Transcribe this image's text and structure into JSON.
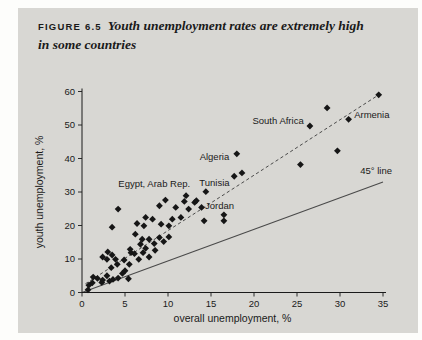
{
  "figure": {
    "label": "FIGURE 6.5",
    "title_line1": "Youth unemployment rates are extremely high",
    "title_line2": "in some countries"
  },
  "colors": {
    "page_bg": "#fdfdfb",
    "panel_bg": "#d8d7d3",
    "ink": "#1a1a1a",
    "marker": "#161616",
    "ref_line": "#4a4a4a",
    "trend_line": "#3a3a3a"
  },
  "chart_data": {
    "type": "scatter",
    "xlabel": "overall unemployment, %",
    "ylabel": "youth unemployment, %",
    "xlim": [
      0,
      35
    ],
    "ylim": [
      0,
      60
    ],
    "xticks": [
      0,
      5,
      10,
      15,
      20,
      25,
      30,
      35
    ],
    "yticks": [
      0,
      10,
      20,
      30,
      40,
      50,
      60
    ],
    "grid": false,
    "legend": "none",
    "points": [
      [
        0.7,
        0.8
      ],
      [
        0.8,
        2.2
      ],
      [
        1.2,
        2.9
      ],
      [
        1.3,
        4.6
      ],
      [
        1.8,
        4.2
      ],
      [
        2.3,
        3.0
      ],
      [
        2.4,
        3.7
      ],
      [
        2.9,
        5.0
      ],
      [
        3.2,
        3.4
      ],
      [
        3.6,
        3.9
      ],
      [
        4.2,
        4.3
      ],
      [
        4.7,
        5.7
      ],
      [
        5.4,
        4.1
      ],
      [
        5.0,
        6.5
      ],
      [
        3.4,
        7.4
      ],
      [
        4.1,
        8.4
      ],
      [
        4.9,
        9.7
      ],
      [
        5.5,
        8.4
      ],
      [
        5.7,
        11.9
      ],
      [
        2.4,
        10.6
      ],
      [
        2.9,
        9.9
      ],
      [
        3.0,
        12.1
      ],
      [
        3.5,
        11.2
      ],
      [
        3.9,
        9.9
      ],
      [
        6.1,
        11.6
      ],
      [
        6.6,
        9.9
      ],
      [
        7.1,
        11.9
      ],
      [
        7.8,
        10.6
      ],
      [
        8.5,
        12.6
      ],
      [
        5.6,
        12.9
      ],
      [
        6.8,
        14.4
      ],
      [
        7.4,
        13.2
      ],
      [
        7.0,
        15.9
      ],
      [
        7.8,
        15.9
      ],
      [
        8.4,
        14.6
      ],
      [
        9.0,
        16.4
      ],
      [
        9.5,
        15.2
      ],
      [
        10.1,
        16.6
      ],
      [
        6.2,
        17.4
      ],
      [
        3.5,
        19.5
      ],
      [
        6.4,
        20.6
      ],
      [
        7.2,
        19.9
      ],
      [
        7.4,
        22.4
      ],
      [
        8.2,
        21.9
      ],
      [
        9.2,
        20.4
      ],
      [
        10.1,
        19.9
      ],
      [
        10.5,
        21.9
      ],
      [
        11.5,
        22.4
      ],
      [
        14.2,
        21.4
      ],
      [
        16.5,
        21.4
      ],
      [
        4.2,
        24.9
      ],
      [
        9.0,
        25.9
      ],
      [
        10.9,
        25.4
      ],
      [
        11.9,
        27.2
      ],
      [
        12.1,
        28.9
      ],
      [
        13.1,
        26.9
      ],
      [
        13.9,
        25.4
      ],
      [
        12.4,
        24.9
      ],
      [
        13.3,
        27.4
      ],
      [
        17.7,
        34.7
      ],
      [
        18.6,
        35.7
      ],
      [
        25.4,
        38.2
      ],
      [
        29.7,
        42.3
      ],
      [
        28.5,
        55.1
      ],
      [
        34.5,
        59.0
      ]
    ],
    "labeled_points": [
      {
        "label": "Egypt, Arab Rep.",
        "x": 9.7,
        "y": 27.6,
        "label_x": 8.4,
        "label_y": 32.3
      },
      {
        "label": "Tunisia",
        "x": 14.4,
        "y": 30.1,
        "label_x": 15.4,
        "label_y": 32.8
      },
      {
        "label": "Jordan",
        "x": 16.5,
        "y": 23.2,
        "label_x": 16.0,
        "label_y": 25.8
      },
      {
        "label": "Algeria",
        "x": 18.0,
        "y": 41.4,
        "label_x": 15.4,
        "label_y": 40.5
      },
      {
        "label": "South Africa",
        "x": 26.5,
        "y": 49.7,
        "label_x": 22.8,
        "label_y": 51.3
      },
      {
        "label": "Armenia",
        "x": 31.0,
        "y": 51.7,
        "label_x": 33.7,
        "label_y": 53.0
      }
    ],
    "lines": [
      {
        "name": "trend-line",
        "style": "dashed",
        "x1": 0.4,
        "y1": 2.6,
        "x2": 34.5,
        "y2": 59.0,
        "label": ""
      },
      {
        "name": "45-degree-line",
        "style": "solid",
        "x1": 0,
        "y1": 0,
        "x2": 35.0,
        "y2": 33.0,
        "label": "45° line",
        "label_x": 34.2,
        "label_y": 36.2
      }
    ]
  }
}
